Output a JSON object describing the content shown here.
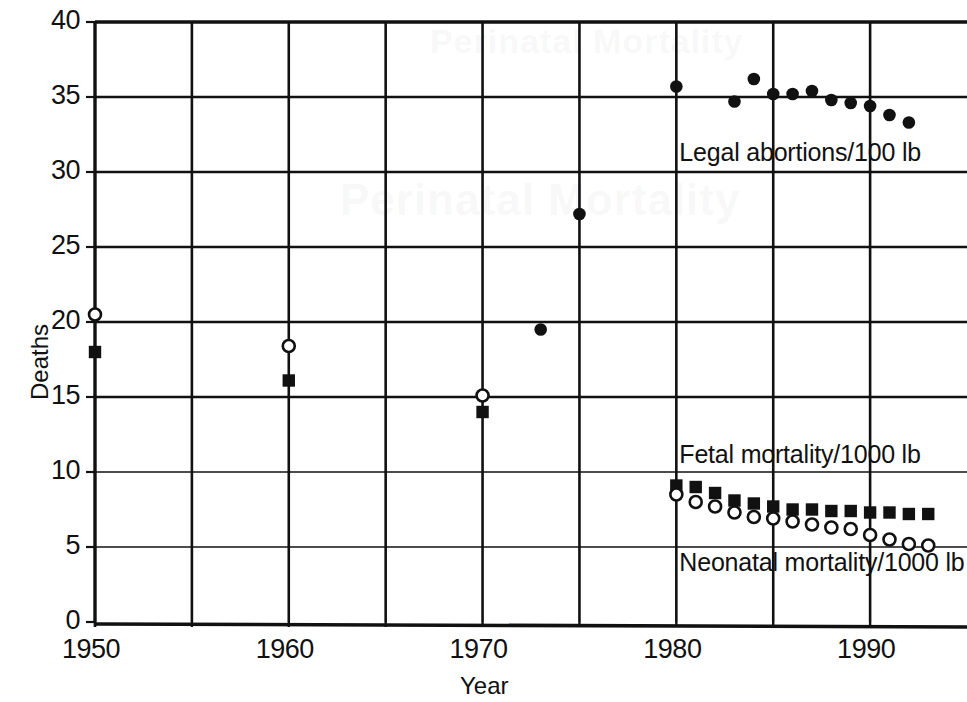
{
  "chart_data": {
    "type": "scatter",
    "title": "",
    "xlabel": "Year",
    "ylabel": "Deaths",
    "xlim": [
      1950,
      1995
    ],
    "ylim": [
      0,
      40
    ],
    "xticks": [
      1950,
      1960,
      1970,
      1980,
      1990
    ],
    "xtick_labels": [
      "1950",
      "1960",
      "1970",
      "1980",
      "1990"
    ],
    "yticks": [
      0,
      5,
      10,
      15,
      20,
      25,
      30,
      35,
      40
    ],
    "ytick_labels": [
      "0",
      "5",
      "10",
      "15",
      "20",
      "25",
      "30",
      "35",
      "40"
    ],
    "x_minor_gridlines": [
      1955,
      1965,
      1975,
      1985,
      1995
    ],
    "grid": true,
    "legend_position": "inline-annotations",
    "series": [
      {
        "name": "Legal abortions/1000 lb",
        "label": "Legal abortions/100 lb",
        "marker": "filled-circle",
        "color": "#111111",
        "points": [
          {
            "x": 1973,
            "y": 19.5
          },
          {
            "x": 1975,
            "y": 27.2
          },
          {
            "x": 1980,
            "y": 35.7
          },
          {
            "x": 1983,
            "y": 34.7
          },
          {
            "x": 1984,
            "y": 36.2
          },
          {
            "x": 1985,
            "y": 35.2
          },
          {
            "x": 1986,
            "y": 35.2
          },
          {
            "x": 1987,
            "y": 35.4
          },
          {
            "x": 1988,
            "y": 34.8
          },
          {
            "x": 1989,
            "y": 34.6
          },
          {
            "x": 1990,
            "y": 34.4
          },
          {
            "x": 1991,
            "y": 33.8
          },
          {
            "x": 1992,
            "y": 33.3
          }
        ]
      },
      {
        "name": "Fetal mortality/1000 lb",
        "label": "Fetal mortality/1000 lb",
        "marker": "filled-square",
        "color": "#111111",
        "points": [
          {
            "x": 1950,
            "y": 18.0
          },
          {
            "x": 1960,
            "y": 16.1
          },
          {
            "x": 1970,
            "y": 14.0
          },
          {
            "x": 1980,
            "y": 9.1
          },
          {
            "x": 1981,
            "y": 9.0
          },
          {
            "x": 1982,
            "y": 8.6
          },
          {
            "x": 1983,
            "y": 8.1
          },
          {
            "x": 1984,
            "y": 7.9
          },
          {
            "x": 1985,
            "y": 7.7
          },
          {
            "x": 1986,
            "y": 7.5
          },
          {
            "x": 1987,
            "y": 7.5
          },
          {
            "x": 1988,
            "y": 7.4
          },
          {
            "x": 1989,
            "y": 7.4
          },
          {
            "x": 1990,
            "y": 7.3
          },
          {
            "x": 1991,
            "y": 7.3
          },
          {
            "x": 1992,
            "y": 7.2
          },
          {
            "x": 1993,
            "y": 7.2
          }
        ]
      },
      {
        "name": "Neonatal mortality/1000 lb",
        "label": "Neonatal mortality/1000 lb",
        "marker": "open-circle",
        "color": "#111111",
        "points": [
          {
            "x": 1950,
            "y": 20.5
          },
          {
            "x": 1960,
            "y": 18.4
          },
          {
            "x": 1970,
            "y": 15.1
          },
          {
            "x": 1980,
            "y": 8.5
          },
          {
            "x": 1981,
            "y": 8.0
          },
          {
            "x": 1982,
            "y": 7.7
          },
          {
            "x": 1983,
            "y": 7.3
          },
          {
            "x": 1984,
            "y": 7.0
          },
          {
            "x": 1985,
            "y": 6.9
          },
          {
            "x": 1986,
            "y": 6.7
          },
          {
            "x": 1987,
            "y": 6.5
          },
          {
            "x": 1988,
            "y": 6.3
          },
          {
            "x": 1989,
            "y": 6.2
          },
          {
            "x": 1990,
            "y": 5.8
          },
          {
            "x": 1991,
            "y": 5.5
          },
          {
            "x": 1992,
            "y": 5.2
          },
          {
            "x": 1993,
            "y": 5.1
          }
        ]
      }
    ],
    "annotations": [
      {
        "text": "Legal abortions/100 lb",
        "x": 1980,
        "y": 31.2
      },
      {
        "text": "Fetal mortality/1000 lb",
        "x": 1980,
        "y": 11.1
      },
      {
        "text": "Neonatal mortality/1000 lb",
        "x": 1980,
        "y": 3.9
      }
    ]
  },
  "ghost_text": {
    "top": "Perinatal Mortality",
    "middle": "Perinatal Mortality"
  }
}
